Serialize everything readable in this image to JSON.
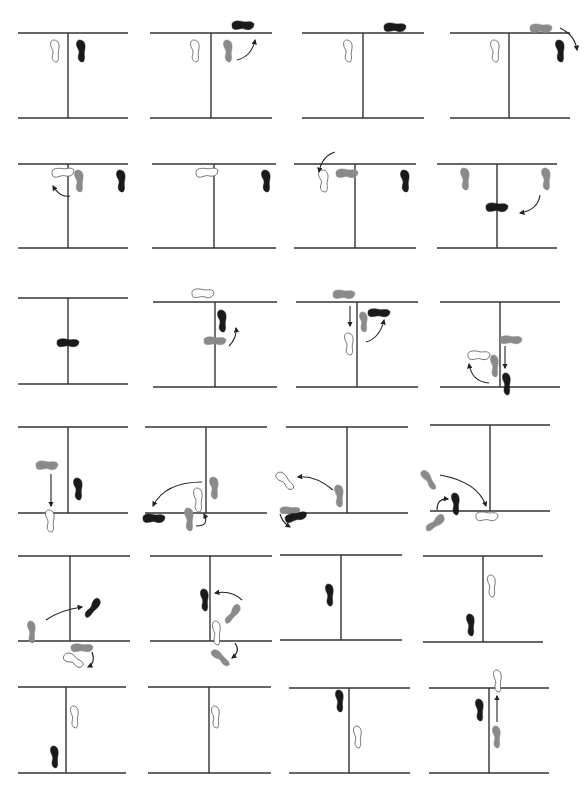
{
  "diagram": {
    "type": "footwork-sequence",
    "colors": {
      "line": "#333333",
      "black_foot": "#1a1a1a",
      "gray_foot": "#8a8a8a",
      "outline_foot": "#ffffff",
      "outline_stroke": "#555555",
      "arrow": "#222222"
    },
    "rows": 6,
    "cols": 4,
    "panels": [
      {
        "id": 1,
        "top": 33,
        "bottom": 118,
        "x1": 18,
        "x2": 128,
        "vx": 68,
        "feet": [
          {
            "kind": "outline",
            "x": 50,
            "y": 40,
            "w": 10,
            "h": 22,
            "rot": 0
          },
          {
            "kind": "black",
            "x": 76,
            "y": 40,
            "w": 10,
            "h": 22,
            "rot": 0
          }
        ],
        "arrows": []
      },
      {
        "id": 2,
        "top": 33,
        "bottom": 118,
        "x1": 150,
        "x2": 272,
        "vx": 211,
        "feet": [
          {
            "kind": "outline",
            "x": 190,
            "y": 40,
            "w": 10,
            "h": 22,
            "rot": 0
          },
          {
            "kind": "gray",
            "x": 223,
            "y": 40,
            "w": 10,
            "h": 22,
            "rot": 0
          },
          {
            "kind": "black",
            "x": 232,
            "y": 20,
            "w": 22,
            "h": 11,
            "rot": 0
          }
        ],
        "arrows": [
          {
            "d": "M237 60 Q252 56 255 40",
            "head": "up"
          }
        ]
      },
      {
        "id": 3,
        "top": 33,
        "bottom": 118,
        "x1": 302,
        "x2": 424,
        "vx": 363,
        "feet": [
          {
            "kind": "outline",
            "x": 343,
            "y": 40,
            "w": 10,
            "h": 22,
            "rot": 0
          },
          {
            "kind": "black",
            "x": 384,
            "y": 22,
            "w": 22,
            "h": 11,
            "rot": 0
          }
        ],
        "arrows": []
      },
      {
        "id": 4,
        "top": 33,
        "bottom": 118,
        "x1": 450,
        "x2": 570,
        "vx": 509,
        "feet": [
          {
            "kind": "outline",
            "x": 490,
            "y": 40,
            "w": 10,
            "h": 22,
            "rot": 0
          },
          {
            "kind": "gray",
            "x": 530,
            "y": 23,
            "w": 22,
            "h": 11,
            "rot": 0
          },
          {
            "kind": "black",
            "x": 555,
            "y": 40,
            "w": 10,
            "h": 22,
            "rot": 0
          }
        ],
        "arrows": [
          {
            "d": "M560 28 Q575 35 577 50",
            "head": "down"
          }
        ]
      },
      {
        "id": 5,
        "top": 164,
        "bottom": 248,
        "x1": 18,
        "x2": 128,
        "vx": 68,
        "feet": [
          {
            "kind": "outline",
            "x": 52,
            "y": 167,
            "w": 22,
            "h": 11,
            "rot": -5
          },
          {
            "kind": "gray",
            "x": 74,
            "y": 170,
            "w": 10,
            "h": 22,
            "rot": 0
          },
          {
            "kind": "black",
            "x": 116,
            "y": 170,
            "w": 10,
            "h": 22,
            "rot": 0
          }
        ],
        "arrows": [
          {
            "d": "M70 196 Q60 198 53 186",
            "head": "up"
          }
        ]
      },
      {
        "id": 6,
        "top": 164,
        "bottom": 248,
        "x1": 152,
        "x2": 276,
        "vx": 214,
        "feet": [
          {
            "kind": "outline",
            "x": 196,
            "y": 167,
            "w": 22,
            "h": 11,
            "rot": -5
          },
          {
            "kind": "black",
            "x": 261,
            "y": 170,
            "w": 10,
            "h": 22,
            "rot": 0
          }
        ],
        "arrows": []
      },
      {
        "id": 7,
        "top": 164,
        "bottom": 248,
        "x1": 294,
        "x2": 416,
        "vx": 355,
        "feet": [
          {
            "kind": "outline",
            "x": 318,
            "y": 170,
            "w": 11,
            "h": 22,
            "rot": 0
          },
          {
            "kind": "gray",
            "x": 336,
            "y": 168,
            "w": 22,
            "h": 11,
            "rot": 0
          },
          {
            "kind": "black",
            "x": 400,
            "y": 170,
            "w": 10,
            "h": 22,
            "rot": 0
          }
        ],
        "arrows": [
          {
            "d": "M335 152 Q322 156 319 172",
            "head": "down"
          }
        ]
      },
      {
        "id": 8,
        "top": 164,
        "bottom": 248,
        "x1": 437,
        "x2": 557,
        "vx": 497,
        "feet": [
          {
            "kind": "gray",
            "x": 460,
            "y": 168,
            "w": 10,
            "h": 22,
            "rot": 0
          },
          {
            "kind": "gray",
            "x": 541,
            "y": 168,
            "w": 10,
            "h": 22,
            "rot": 0
          },
          {
            "kind": "black",
            "x": 486,
            "y": 202,
            "w": 22,
            "h": 11,
            "rot": 0
          }
        ],
        "arrows": [
          {
            "d": "M540 195 Q538 210 520 213",
            "head": "left"
          }
        ]
      },
      {
        "id": 9,
        "top": 298,
        "bottom": 384,
        "x1": 18,
        "x2": 128,
        "vx": 68,
        "feet": [
          {
            "kind": "black",
            "x": 57,
            "y": 338,
            "w": 22,
            "h": 10,
            "rot": 0
          }
        ],
        "arrows": []
      },
      {
        "id": 10,
        "top": 302,
        "bottom": 387,
        "x1": 153,
        "x2": 277,
        "vx": 215,
        "feet": [
          {
            "kind": "outline",
            "x": 192,
            "y": 288,
            "w": 22,
            "h": 11,
            "rot": 0
          },
          {
            "kind": "black",
            "x": 217,
            "y": 310,
            "w": 10,
            "h": 22,
            "rot": 0
          },
          {
            "kind": "gray",
            "x": 204,
            "y": 336,
            "w": 22,
            "h": 10,
            "rot": 0
          }
        ],
        "arrows": [
          {
            "d": "M229 346 Q237 338 236 328",
            "head": "up"
          }
        ]
      },
      {
        "id": 11,
        "top": 302,
        "bottom": 387,
        "x1": 296,
        "x2": 418,
        "vx": 357,
        "feet": [
          {
            "kind": "gray",
            "x": 333,
            "y": 289,
            "w": 22,
            "h": 11,
            "rot": 0
          },
          {
            "kind": "gray",
            "x": 359,
            "y": 312,
            "w": 9,
            "h": 20,
            "rot": 0
          },
          {
            "kind": "black",
            "x": 368,
            "y": 308,
            "w": 22,
            "h": 10,
            "rot": 0
          },
          {
            "kind": "outline",
            "x": 344,
            "y": 333,
            "w": 10,
            "h": 22,
            "rot": 0
          }
        ],
        "arrows": [
          {
            "d": "M350 306 L350 326",
            "head": "down"
          },
          {
            "d": "M366 342 Q380 338 384 320",
            "head": "up"
          }
        ]
      },
      {
        "id": 12,
        "top": 302,
        "bottom": 387,
        "x1": 440,
        "x2": 560,
        "vx": 500,
        "feet": [
          {
            "kind": "gray",
            "x": 500,
            "y": 335,
            "w": 22,
            "h": 10,
            "rot": 0
          },
          {
            "kind": "outline",
            "x": 468,
            "y": 350,
            "w": 22,
            "h": 11,
            "rot": 0
          },
          {
            "kind": "gray",
            "x": 490,
            "y": 355,
            "w": 9,
            "h": 22,
            "rot": 0
          },
          {
            "kind": "black",
            "x": 502,
            "y": 373,
            "w": 9,
            "h": 22,
            "rot": 0
          }
        ],
        "arrows": [
          {
            "d": "M505 346 L505 368",
            "head": "down"
          },
          {
            "d": "M489 383 Q472 382 469 364",
            "head": "up"
          }
        ]
      },
      {
        "id": 13,
        "top": 427,
        "bottom": 513,
        "x1": 18,
        "x2": 128,
        "vx": 68,
        "feet": [
          {
            "kind": "gray",
            "x": 36,
            "y": 460,
            "w": 22,
            "h": 11,
            "rot": 0
          },
          {
            "kind": "black",
            "x": 73,
            "y": 478,
            "w": 10,
            "h": 22,
            "rot": 0
          },
          {
            "kind": "outline",
            "x": 45,
            "y": 510,
            "w": 10,
            "h": 22,
            "rot": 0
          }
        ],
        "arrows": [
          {
            "d": "M51 474 L51 506",
            "head": "down"
          }
        ]
      },
      {
        "id": 14,
        "top": 427,
        "bottom": 513,
        "x1": 145,
        "x2": 267,
        "vx": 206,
        "feet": [
          {
            "kind": "gray",
            "x": 209,
            "y": 477,
            "w": 10,
            "h": 22,
            "rot": 0
          },
          {
            "kind": "outline",
            "x": 193,
            "y": 488,
            "w": 10,
            "h": 24,
            "rot": 0
          },
          {
            "kind": "black",
            "x": 143,
            "y": 513,
            "w": 22,
            "h": 11,
            "rot": 0
          },
          {
            "kind": "gray",
            "x": 184,
            "y": 508,
            "w": 10,
            "h": 23,
            "rot": 0
          }
        ],
        "arrows": [
          {
            "d": "M202 482 Q165 482 153 506",
            "head": "down"
          },
          {
            "d": "M196 526 Q210 526 204 514",
            "head": "up"
          }
        ]
      },
      {
        "id": 15,
        "top": 427,
        "bottom": 513,
        "x1": 286,
        "x2": 408,
        "vx": 347,
        "feet": [
          {
            "kind": "outline",
            "x": 280,
            "y": 470,
            "w": 10,
            "h": 22,
            "rot": -40
          },
          {
            "kind": "gray",
            "x": 334,
            "y": 485,
            "w": 10,
            "h": 22,
            "rot": 0
          },
          {
            "kind": "gray",
            "x": 280,
            "y": 506,
            "w": 20,
            "h": 9,
            "rot": 0
          },
          {
            "kind": "black",
            "x": 285,
            "y": 512,
            "w": 22,
            "h": 10,
            "rot": -15
          }
        ],
        "arrows": [
          {
            "d": "M333 490 Q315 475 298 477",
            "head": "left"
          },
          {
            "d": "M280 514 Q282 522 290 527",
            "head": "down"
          }
        ]
      },
      {
        "id": 16,
        "top": 425,
        "bottom": 511,
        "x1": 430,
        "x2": 550,
        "vx": 490,
        "feet": [
          {
            "kind": "gray",
            "x": 424,
            "y": 469,
            "w": 9,
            "h": 22,
            "rot": -30
          },
          {
            "kind": "black",
            "x": 451,
            "y": 493,
            "w": 9,
            "h": 22,
            "rot": 0
          },
          {
            "kind": "gray",
            "x": 430,
            "y": 512,
            "w": 10,
            "h": 22,
            "rot": 55
          },
          {
            "kind": "outline",
            "x": 476,
            "y": 511,
            "w": 22,
            "h": 11,
            "rot": 0
          }
        ],
        "arrows": [
          {
            "d": "M440 475 Q478 482 486 506",
            "head": "down"
          },
          {
            "d": "M437 510 Q437 498 448 499",
            "head": "right"
          }
        ]
      },
      {
        "id": 17,
        "top": 556,
        "bottom": 641,
        "x1": 18,
        "x2": 130,
        "vx": 70,
        "feet": [
          {
            "kind": "gray",
            "x": 27,
            "y": 621,
            "w": 9,
            "h": 22,
            "rot": 0
          },
          {
            "kind": "black",
            "x": 88,
            "y": 597,
            "w": 9,
            "h": 22,
            "rot": 40
          },
          {
            "kind": "gray",
            "x": 71,
            "y": 643,
            "w": 22,
            "h": 10,
            "rot": 0
          },
          {
            "kind": "outline",
            "x": 68,
            "y": 650,
            "w": 11,
            "h": 21,
            "rot": -55
          }
        ],
        "arrows": [
          {
            "d": "M46 620 Q60 610 82 607",
            "head": "right"
          },
          {
            "d": "M92 652 Q96 663 88 667",
            "head": "down"
          }
        ]
      },
      {
        "id": 18,
        "top": 556,
        "bottom": 641,
        "x1": 150,
        "x2": 272,
        "vx": 210,
        "feet": [
          {
            "kind": "black",
            "x": 200,
            "y": 589,
            "w": 9,
            "h": 22,
            "rot": 0
          },
          {
            "kind": "gray",
            "x": 228,
            "y": 603,
            "w": 9,
            "h": 22,
            "rot": 40
          },
          {
            "kind": "outline",
            "x": 212,
            "y": 621,
            "w": 9,
            "h": 24,
            "rot": 0
          },
          {
            "kind": "gray",
            "x": 216,
            "y": 647,
            "w": 9,
            "h": 22,
            "rot": -45
          }
        ],
        "arrows": [
          {
            "d": "M242 600 Q232 590 215 593",
            "head": "left"
          },
          {
            "d": "M235 643 Q241 651 232 658",
            "head": "down"
          }
        ]
      },
      {
        "id": 19,
        "top": 555,
        "bottom": 640,
        "x1": 280,
        "x2": 402,
        "vx": 341,
        "feet": [
          {
            "kind": "black",
            "x": 325,
            "y": 584,
            "w": 9,
            "h": 22,
            "rot": 0
          }
        ],
        "arrows": []
      },
      {
        "id": 20,
        "top": 556,
        "bottom": 642,
        "x1": 423,
        "x2": 543,
        "vx": 483,
        "feet": [
          {
            "kind": "outline",
            "x": 487,
            "y": 575,
            "w": 9,
            "h": 22,
            "rot": 0
          },
          {
            "kind": "black",
            "x": 466,
            "y": 614,
            "w": 9,
            "h": 22,
            "rot": 0
          }
        ],
        "arrows": []
      },
      {
        "id": 21,
        "top": 687,
        "bottom": 773,
        "x1": 18,
        "x2": 126,
        "vx": 66,
        "feet": [
          {
            "kind": "outline",
            "x": 70,
            "y": 706,
            "w": 9,
            "h": 22,
            "rot": 0
          },
          {
            "kind": "black",
            "x": 50,
            "y": 746,
            "w": 9,
            "h": 22,
            "rot": 0
          }
        ],
        "arrows": []
      },
      {
        "id": 22,
        "top": 687,
        "bottom": 773,
        "x1": 148,
        "x2": 271,
        "vx": 209,
        "feet": [
          {
            "kind": "outline",
            "x": 211,
            "y": 706,
            "w": 9,
            "h": 22,
            "rot": 0
          }
        ],
        "arrows": []
      },
      {
        "id": 23,
        "top": 688,
        "bottom": 773,
        "x1": 289,
        "x2": 410,
        "vx": 349,
        "feet": [
          {
            "kind": "black",
            "x": 335,
            "y": 690,
            "w": 9,
            "h": 22,
            "rot": 0
          },
          {
            "kind": "outline",
            "x": 353,
            "y": 726,
            "w": 9,
            "h": 22,
            "rot": 0
          }
        ],
        "arrows": []
      },
      {
        "id": 24,
        "top": 688,
        "bottom": 773,
        "x1": 429,
        "x2": 549,
        "vx": 489,
        "feet": [
          {
            "kind": "outline",
            "x": 493,
            "y": 670,
            "w": 9,
            "h": 22,
            "rot": 0
          },
          {
            "kind": "black",
            "x": 475,
            "y": 699,
            "w": 9,
            "h": 22,
            "rot": 0
          },
          {
            "kind": "gray",
            "x": 492,
            "y": 726,
            "w": 9,
            "h": 22,
            "rot": 0
          }
        ],
        "arrows": [
          {
            "d": "M497 722 L497 696",
            "head": "up"
          }
        ]
      }
    ]
  }
}
